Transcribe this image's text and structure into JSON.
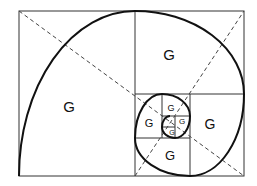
{
  "diagram": {
    "colors": {
      "background": "#ffffff",
      "lines": "#333333",
      "spiral": "#111111",
      "dashed": "#444444"
    },
    "labels": [
      {
        "text": "G",
        "x": 69,
        "y": 106,
        "size": 15,
        "region": "large-left-square"
      },
      {
        "text": "G",
        "x": 169,
        "y": 54,
        "size": 15,
        "region": "top-right-square"
      },
      {
        "text": "G",
        "x": 210,
        "y": 124,
        "size": 14,
        "region": "right-square"
      },
      {
        "text": "G",
        "x": 170,
        "y": 155,
        "size": 13,
        "region": "bottom-square"
      },
      {
        "text": "G",
        "x": 149,
        "y": 123,
        "size": 11,
        "region": "left-inner-square"
      },
      {
        "text": "G",
        "x": 171,
        "y": 108,
        "size": 9,
        "region": "top-inner-square"
      },
      {
        "text": "G",
        "x": 182,
        "y": 122,
        "size": 8,
        "region": "right-inner-square"
      },
      {
        "text": "G",
        "x": 172,
        "y": 132,
        "size": 7,
        "region": "bottom-inner-square"
      }
    ]
  }
}
